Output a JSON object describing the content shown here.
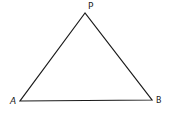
{
  "diagram": {
    "type": "triangle",
    "stroke_color": "#1a1a1a",
    "stroke_width": 1.2,
    "vertices": [
      {
        "name": "P",
        "x": 85,
        "y": 13
      },
      {
        "name": "A",
        "x": 20,
        "y": 101
      },
      {
        "name": "B",
        "x": 152,
        "y": 100
      }
    ],
    "labels": {
      "P": "P",
      "A": "A",
      "B": "B"
    }
  }
}
